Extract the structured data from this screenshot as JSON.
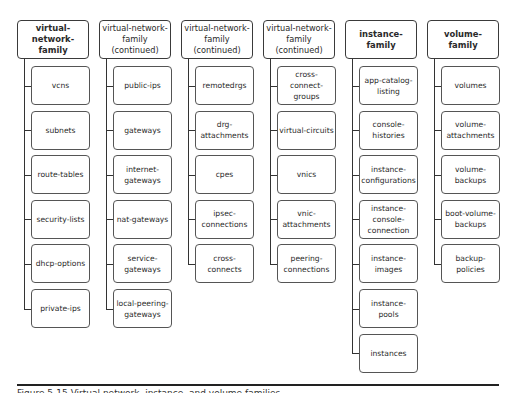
{
  "columns": [
    {
      "header": "virtual-network-family",
      "bold": true,
      "children": [
        "vcns",
        "subnets",
        "route-tables",
        "security-lists",
        "dhcp-options",
        "private-ips"
      ]
    },
    {
      "header": "virtual-network-family (continued)",
      "bold": false,
      "children": [
        "public-ips",
        "gateways",
        "internet-gateways",
        "nat-gateways",
        "service-gateways",
        "local-peering-gateways"
      ]
    },
    {
      "header": "virtual-network-family (continued)",
      "bold": false,
      "children": [
        "remotedrgs",
        "drg-attachments",
        "cpes",
        "ipsec-connections",
        "cross-connects"
      ]
    },
    {
      "header": "virtual-network-family (continued)",
      "bold": false,
      "children": [
        "cross-connect-groups",
        "virtual-circuits",
        "vnics",
        "vnic-attachments",
        "peering-connections"
      ]
    },
    {
      "header": "instance-family",
      "bold": true,
      "children": [
        "app-catalog-listing",
        "console-histories",
        "instance-configurations",
        "instance-console-connection",
        "instance-images",
        "instance-pools",
        "instances"
      ]
    },
    {
      "header": "volume-family",
      "bold": true,
      "children": [
        "volumes",
        "volume-attachments",
        "volume-backups",
        "boot-volume-backups",
        "backup-policies"
      ]
    }
  ],
  "caption": "Figure 5-15 Virtual network, instance, and volume families"
}
